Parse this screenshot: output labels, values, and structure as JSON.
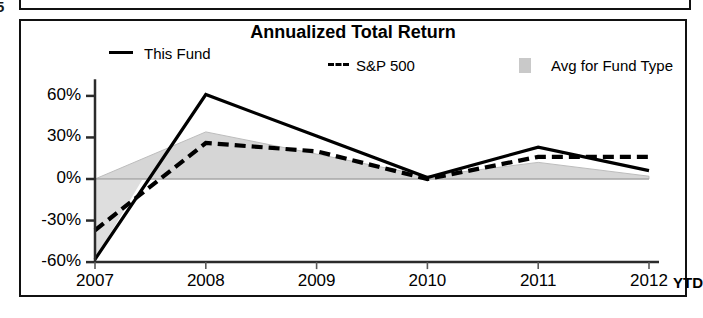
{
  "scan": {
    "edge_fragment": "5"
  },
  "chart": {
    "title": "Annualized Total Return",
    "axis_suffix_label": "YTD",
    "legend": [
      {
        "name": "legend-this-fund",
        "label": "This Fund",
        "style": "solid",
        "color": "#000000"
      },
      {
        "name": "legend-sp-500",
        "label": "S&P 500",
        "style": "dashed",
        "color": "#000000",
        "prefix": "---"
      },
      {
        "name": "legend-avg-fund-type",
        "label": "Avg for Fund Type",
        "style": "area",
        "color": "#c9c9c9"
      }
    ]
  },
  "chart_data": {
    "type": "line",
    "title": "Annualized Total Return",
    "xlabel": "",
    "ylabel": "",
    "grid": false,
    "legend_position": "top",
    "categories": [
      "2007",
      "2008",
      "2009",
      "2010",
      "2011",
      "2012"
    ],
    "x_tick_labels": [
      "2007",
      "2008",
      "2009",
      "2010",
      "2011",
      "2012"
    ],
    "y_tick_labels": [
      "60%",
      "30%",
      "0%",
      "-30%",
      "-60%"
    ],
    "y_ticks": [
      60,
      30,
      0,
      -30,
      -60
    ],
    "ylim": [
      -60,
      72
    ],
    "yunit": "percent",
    "series": [
      {
        "name": "This Fund",
        "style": "solid",
        "color": "#000000",
        "values": [
          -58,
          61,
          31,
          1,
          23,
          6
        ]
      },
      {
        "name": "S&P 500",
        "style": "dashed",
        "color": "#000000",
        "values": [
          -37,
          26,
          20,
          0,
          16,
          16
        ]
      },
      {
        "name": "Avg for Fund Type",
        "style": "area",
        "color": "#cccccc",
        "values": [
          0,
          34,
          18,
          2,
          12,
          2
        ]
      }
    ]
  }
}
